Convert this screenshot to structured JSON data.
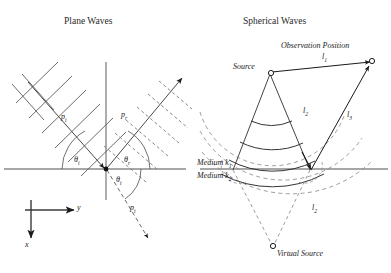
{
  "figure": {
    "panels": [
      {
        "id": "plane-waves",
        "title": "Plane Waves",
        "labels": {
          "incident_pressure": "p",
          "incident_pressure_sub": "i",
          "reflected_pressure": "p",
          "reflected_pressure_sub": "r",
          "transmitted_pressure": "p",
          "transmitted_pressure_sub": "t",
          "angle_incident": "θ",
          "angle_incident_sub": "i",
          "angle_reflected": "θ",
          "angle_reflected_sub": "r",
          "angle_transmitted": "θ",
          "angle_transmitted_sub": "t"
        },
        "axes": {
          "horizontal_label": "y",
          "vertical_label": "x"
        }
      },
      {
        "id": "spherical-waves",
        "title": "Spherical Waves",
        "labels": {
          "observation": "Observation Position",
          "source": "Source",
          "virtual_source": "Virtual Source",
          "path1": "l",
          "path1_sub": "1",
          "path2": "l",
          "path2_sub": "2",
          "path3": "l",
          "path3_sub": "3",
          "path2_lower": "l",
          "path2_lower_sub": "2",
          "medium1": "Medium k",
          "medium1_sub": "1",
          "medium2": "Medium k",
          "medium2_sub": "2"
        }
      }
    ],
    "colors": {
      "ink": "#1a1a1a",
      "interface": "#8a8a8a",
      "wavefront": "#555555",
      "dashed": "#7a7a7a"
    }
  }
}
